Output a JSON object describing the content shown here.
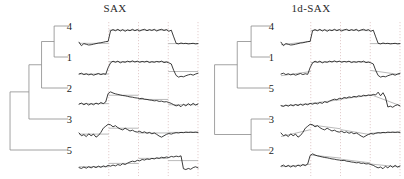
{
  "figure": {
    "background_color": "#ffffff",
    "width": 404,
    "height": 179,
    "series_color": "#1a1a1a",
    "approx_color": "#a8a8a8",
    "gridline_color": "#d9b9b9",
    "dendrogram_color": "#8c8c8c"
  },
  "panels": [
    {
      "id": "sax",
      "title": "SAX",
      "leaf_labels": [
        "4",
        "1",
        "2",
        "3",
        "5"
      ]
    },
    {
      "id": "1d-sax",
      "title": "1d-SAX",
      "leaf_labels": [
        "4",
        "1",
        "5",
        "3",
        "2"
      ]
    }
  ],
  "chart_data": {
    "type": "line",
    "xlabel": "",
    "ylabel": "",
    "grid": "vertical dotted segment boundaries at x = 0.25, 0.50, 0.75, 1.00",
    "legend": "none",
    "n_segments": 4,
    "panels": [
      {
        "name": "SAX",
        "title": "SAX",
        "dendrogram": {
          "leaf_order": [
            "4",
            "1",
            "2",
            "3",
            "5"
          ],
          "merges": [
            {
              "members": [
                "4",
                "1"
              ],
              "height": 0.22
            },
            {
              "members": [
                "4",
                "1",
                "2"
              ],
              "height": 0.42
            },
            {
              "members": [
                "4",
                "1",
                "2",
                "3"
              ],
              "height": 0.62
            },
            {
              "members": [
                "4",
                "1",
                "2",
                "3",
                "5"
              ],
              "height": 0.92
            }
          ]
        },
        "series": [
          {
            "name": "4",
            "y": [
              -0.3,
              -0.55,
              -0.4,
              -0.45,
              -0.5,
              -0.48,
              -0.44,
              -0.4,
              -0.36,
              -0.34,
              -0.3,
              -0.26,
              -0.24,
              0.52,
              0.6,
              0.52,
              0.62,
              0.5,
              0.6,
              0.48,
              0.58,
              0.52,
              0.62,
              0.52,
              0.6,
              0.5,
              0.58,
              0.62,
              0.52,
              0.6,
              0.54,
              0.62,
              0.5,
              0.58,
              0.62,
              0.54,
              0.6,
              0.48,
              0.56,
              0.08,
              -0.38,
              -0.42,
              -0.36,
              -0.4,
              -0.38,
              -0.42,
              -0.4,
              -0.38,
              -0.42,
              -0.4
            ],
            "sax_segments": [
              -0.38,
              0.56,
              0.56,
              -0.4
            ]
          },
          {
            "name": "1",
            "y": [
              -0.36,
              -0.3,
              -0.4,
              -0.34,
              -0.42,
              -0.36,
              -0.44,
              -0.38,
              -0.32,
              -0.4,
              -0.34,
              -0.38,
              0.1,
              0.44,
              0.56,
              0.48,
              0.56,
              0.44,
              0.52,
              0.48,
              0.56,
              0.5,
              0.58,
              0.5,
              0.56,
              0.48,
              0.54,
              0.5,
              0.56,
              0.46,
              0.52,
              0.48,
              0.54,
              0.5,
              0.56,
              0.46,
              0.5,
              0.44,
              0.36,
              -0.1,
              -0.46,
              -0.58,
              -0.52,
              -0.56,
              -0.48,
              -0.42,
              -0.38,
              -0.44,
              -0.36,
              -0.3
            ],
            "sax_segments": [
              -0.36,
              0.52,
              0.52,
              -0.18
            ]
          },
          {
            "name": "2",
            "y": [
              -0.3,
              -0.22,
              -0.34,
              -0.24,
              -0.36,
              -0.26,
              -0.34,
              -0.22,
              -0.3,
              -0.18,
              -0.26,
              -0.14,
              0.46,
              0.58,
              0.5,
              0.44,
              0.4,
              0.36,
              0.32,
              0.3,
              0.26,
              0.22,
              0.2,
              0.16,
              0.14,
              0.1,
              0.12,
              0.06,
              0.04,
              0.0,
              -0.02,
              -0.06,
              -0.04,
              -0.1,
              -0.08,
              -0.14,
              -0.12,
              -0.18,
              -0.24,
              -0.34,
              -0.42,
              -0.36,
              -0.48,
              -0.3,
              -0.42,
              -0.26,
              -0.38,
              -0.24,
              -0.36,
              -0.28
            ],
            "sax_segments": [
              -0.26,
              0.34,
              0.04,
              -0.34
            ]
          },
          {
            "name": "3",
            "y": [
              -0.14,
              -0.34,
              -0.26,
              -0.4,
              -0.2,
              -0.34,
              -0.22,
              -0.44,
              -0.32,
              -0.1,
              0.2,
              0.34,
              0.48,
              0.44,
              0.3,
              0.38,
              0.24,
              0.14,
              0.08,
              0.2,
              0.1,
              0.0,
              0.06,
              -0.04,
              -0.08,
              -0.02,
              -0.12,
              -0.06,
              -0.16,
              -0.1,
              -0.2,
              -0.14,
              -0.24,
              -0.36,
              -0.44,
              -0.34,
              -0.24,
              -0.18,
              -0.22,
              -0.16,
              -0.12,
              -0.14,
              -0.1,
              -0.12,
              -0.08,
              -0.1,
              -0.08,
              -0.1,
              -0.08,
              -0.1
            ],
            "sax_segments": [
              -0.22,
              0.2,
              -0.14,
              -0.1
            ]
          },
          {
            "name": "5",
            "y": [
              -0.4,
              -0.46,
              -0.36,
              -0.44,
              -0.34,
              -0.42,
              -0.32,
              -0.4,
              -0.3,
              -0.38,
              -0.28,
              -0.34,
              -0.24,
              -0.3,
              -0.22,
              -0.28,
              -0.18,
              -0.24,
              -0.12,
              -0.18,
              -0.08,
              0.0,
              0.06,
              0.02,
              0.12,
              0.08,
              0.18,
              0.14,
              0.22,
              0.18,
              0.26,
              0.22,
              0.3,
              0.26,
              0.34,
              0.3,
              0.36,
              0.32,
              0.4,
              0.36,
              0.42,
              0.38,
              0.44,
              -0.48,
              -0.54,
              -0.46,
              -0.52,
              -0.4,
              -0.34,
              -0.42
            ],
            "sax_segments": [
              -0.34,
              -0.1,
              0.26,
              0.1
            ]
          }
        ]
      },
      {
        "name": "1d-SAX",
        "title": "1d-SAX",
        "dendrogram": {
          "leaf_order": [
            "4",
            "1",
            "5",
            "3",
            "2"
          ],
          "merges": [
            {
              "members": [
                "4",
                "1"
              ],
              "height": 0.3
            },
            {
              "members": [
                "4",
                "1",
                "5"
              ],
              "height": 0.52
            },
            {
              "members": [
                "3",
                "2"
              ],
              "height": 0.3
            },
            {
              "members": [
                "4",
                "1",
                "5",
                "3",
                "2"
              ],
              "height": 0.88
            }
          ]
        },
        "series": [
          {
            "name": "4",
            "y": [
              -0.3,
              -0.55,
              -0.4,
              -0.45,
              -0.5,
              -0.48,
              -0.44,
              -0.4,
              -0.36,
              -0.34,
              -0.3,
              -0.26,
              -0.24,
              0.52,
              0.6,
              0.52,
              0.62,
              0.5,
              0.6,
              0.48,
              0.58,
              0.52,
              0.62,
              0.52,
              0.6,
              0.5,
              0.58,
              0.62,
              0.52,
              0.6,
              0.54,
              0.62,
              0.5,
              0.58,
              0.62,
              0.54,
              0.6,
              0.48,
              0.56,
              0.08,
              -0.38,
              -0.42,
              -0.36,
              -0.4,
              -0.38,
              -0.42,
              -0.4,
              -0.38,
              -0.42,
              -0.4
            ],
            "linear_segments": [
              [
                -0.48,
                -0.24
              ],
              [
                0.54,
                0.58
              ],
              [
                0.58,
                0.52
              ],
              [
                -0.4,
                -0.4
              ]
            ]
          },
          {
            "name": "1",
            "y": [
              -0.36,
              -0.3,
              -0.4,
              -0.34,
              -0.42,
              -0.36,
              -0.44,
              -0.38,
              -0.32,
              -0.4,
              -0.34,
              -0.38,
              0.1,
              0.44,
              0.56,
              0.48,
              0.56,
              0.44,
              0.52,
              0.48,
              0.56,
              0.5,
              0.58,
              0.5,
              0.56,
              0.48,
              0.54,
              0.5,
              0.56,
              0.46,
              0.52,
              0.48,
              0.54,
              0.5,
              0.56,
              0.46,
              0.5,
              0.44,
              0.36,
              -0.1,
              -0.46,
              -0.58,
              -0.52,
              -0.56,
              -0.48,
              -0.42,
              -0.38,
              -0.44,
              -0.36,
              -0.3
            ],
            "linear_segments": [
              [
                -0.48,
                -0.18
              ],
              [
                0.46,
                0.54
              ],
              [
                0.54,
                0.48
              ],
              [
                -0.1,
                -0.4
              ]
            ]
          },
          {
            "name": "5",
            "y": [
              -0.4,
              -0.46,
              -0.36,
              -0.44,
              -0.34,
              -0.42,
              -0.32,
              -0.4,
              -0.3,
              -0.38,
              -0.28,
              -0.34,
              -0.24,
              -0.3,
              -0.22,
              -0.28,
              -0.18,
              -0.24,
              -0.12,
              -0.18,
              -0.08,
              0.0,
              0.06,
              0.02,
              0.12,
              0.08,
              0.18,
              0.14,
              0.22,
              0.18,
              0.26,
              0.22,
              0.3,
              0.26,
              0.34,
              0.3,
              0.36,
              0.32,
              0.4,
              0.36,
              0.56,
              0.3,
              0.52,
              0.2,
              -0.5,
              -0.44,
              -0.52,
              -0.4,
              -0.34,
              -0.42
            ],
            "linear_segments": [
              [
                -0.42,
                -0.26
              ],
              [
                -0.24,
                0.02
              ],
              [
                0.06,
                0.34
              ],
              [
                0.4,
                -0.4
              ]
            ]
          },
          {
            "name": "3",
            "y": [
              -0.14,
              -0.34,
              -0.26,
              -0.4,
              -0.2,
              -0.34,
              -0.22,
              -0.44,
              -0.32,
              -0.1,
              0.2,
              0.34,
              0.48,
              0.44,
              0.3,
              0.38,
              0.24,
              0.14,
              0.08,
              0.2,
              0.1,
              0.0,
              0.06,
              -0.04,
              -0.08,
              -0.02,
              -0.12,
              -0.06,
              -0.16,
              -0.1,
              -0.2,
              -0.14,
              -0.24,
              -0.36,
              -0.44,
              -0.34,
              -0.24,
              -0.18,
              -0.22,
              -0.16,
              -0.12,
              -0.14,
              -0.1,
              -0.12,
              -0.08,
              -0.1,
              -0.08,
              -0.1,
              -0.08,
              -0.1
            ],
            "linear_segments": [
              [
                -0.4,
                0.1
              ],
              [
                0.44,
                0.16
              ],
              [
                0.1,
                -0.26
              ],
              [
                -0.16,
                -0.08
              ]
            ]
          },
          {
            "name": "2",
            "y": [
              -0.3,
              -0.22,
              -0.34,
              -0.24,
              -0.36,
              -0.26,
              -0.34,
              -0.22,
              -0.3,
              -0.18,
              -0.26,
              -0.14,
              0.46,
              0.58,
              0.5,
              0.44,
              0.4,
              0.36,
              0.32,
              0.3,
              0.26,
              0.22,
              0.2,
              0.16,
              0.14,
              0.1,
              0.12,
              0.06,
              0.04,
              0.0,
              -0.02,
              -0.06,
              -0.04,
              -0.1,
              -0.08,
              -0.14,
              -0.12,
              -0.18,
              -0.24,
              -0.34,
              -0.42,
              -0.36,
              -0.48,
              -0.3,
              -0.42,
              -0.26,
              -0.38,
              -0.24,
              -0.36,
              -0.28
            ],
            "linear_segments": [
              [
                -0.34,
                -0.16
              ],
              [
                0.5,
                0.28
              ],
              [
                0.2,
                -0.06
              ],
              [
                -0.14,
                -0.36
              ]
            ]
          }
        ]
      }
    ]
  }
}
